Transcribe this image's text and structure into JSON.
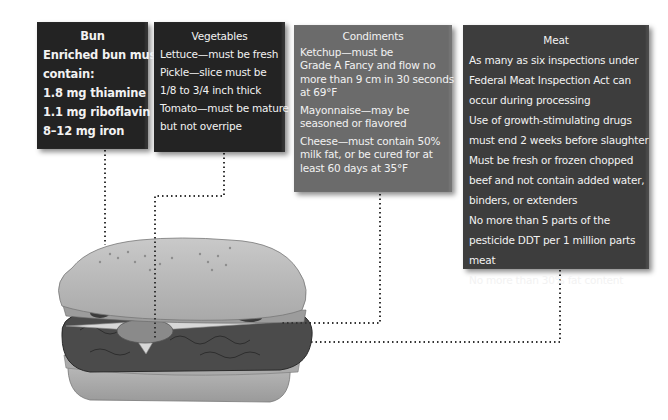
{
  "diagram": {
    "colors": {
      "bun_box": "#232323",
      "vegetables_box": "#232323",
      "condiments_box": "#6b6b6b",
      "meat_box": "#3d3d3d",
      "text": "#f2f2f2",
      "connector": "#333333"
    },
    "boxes": {
      "bun": {
        "title": "Bun",
        "lines": [
          "Enriched bun must",
          "contain:",
          "1.8 mg thiamine",
          "1.1 mg riboflavin",
          "8–12 mg iron"
        ]
      },
      "vegetables": {
        "title": "Vegetables",
        "lines": [
          "Lettuce—must be fresh",
          "Pickle—slice must be",
          "1/8 to 3/4 inch thick",
          "Tomato—must be mature",
          "but not overripe"
        ]
      },
      "condiments": {
        "title": "Condiments",
        "items": [
          [
            "Ketchup—must be",
            "Grade A Fancy and flow no",
            "more than 9 cm in 30 seconds",
            "at 69°F"
          ],
          [
            "Mayonnaise—may be",
            "seasoned or flavored"
          ],
          [
            "Cheese—must contain 50%",
            "milk fat, or be cured for at",
            "least 60 days at 35°F"
          ]
        ]
      },
      "meat": {
        "title": "Meat",
        "lines": [
          "As many as six inspections under",
          "Federal Meat Inspection Act can",
          "occur during processing",
          "Use of growth-stimulating drugs",
          "must end 2 weeks before slaughter",
          "Must be fresh or frozen chopped",
          "beef and not contain added water,",
          "binders, or extenders",
          "No more than 5 parts of the",
          "pesticide DDT per 1 million parts",
          "meat",
          "No more than 30% fat content"
        ]
      }
    }
  }
}
